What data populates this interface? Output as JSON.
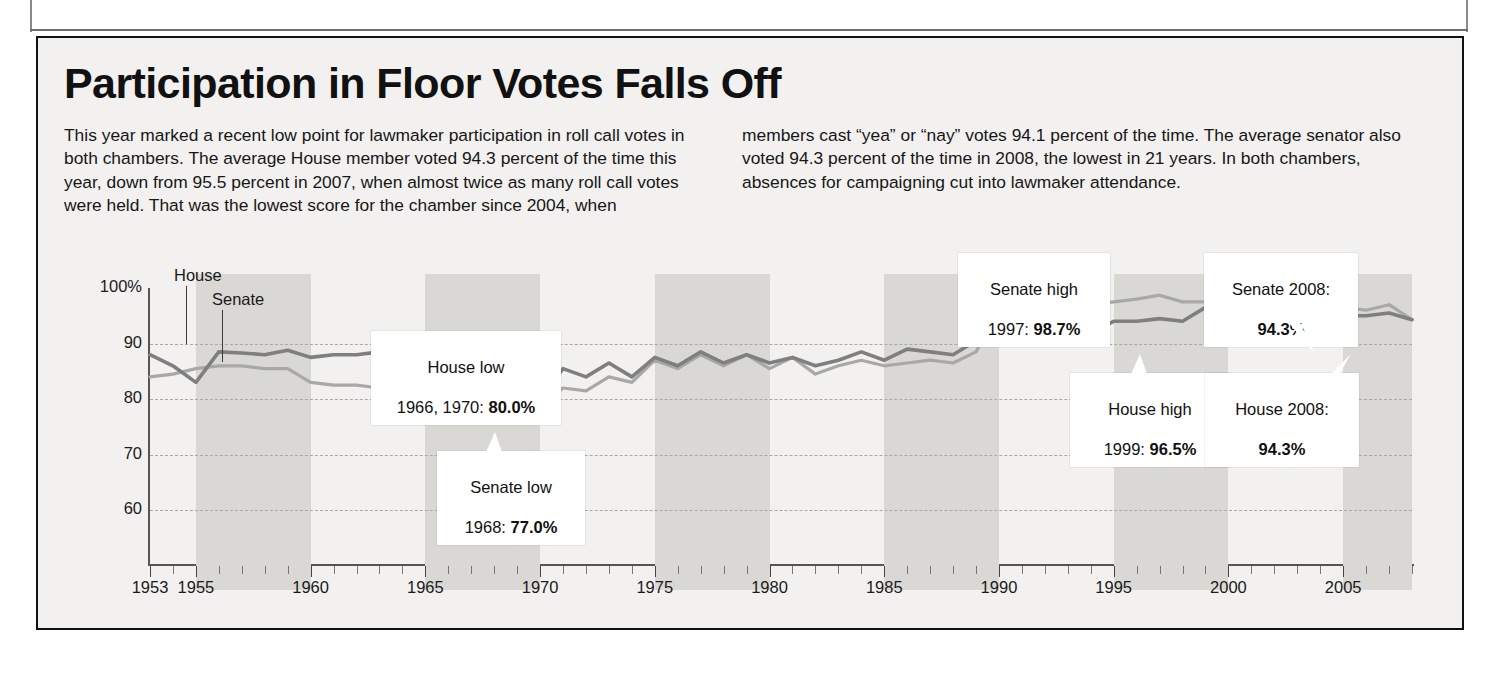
{
  "headline": "Participation in Floor Votes Falls Off",
  "deck": {
    "left": "This year marked a recent low point for lawmaker participation in roll call votes in both chambers. The average House member voted 94.3 percent of the time this year, down from 95.5 percent in 2007, when almost twice as many roll call votes were held. That was the lowest score for the chamber since 2004, when",
    "right": "members cast “yea” or “nay” votes 94.1 percent of the time. The average senator also voted 94.3 percent of the time in 2008, the lowest in 21 years. In both chambers, absences for campaigning cut into lawmaker attendance."
  },
  "series_labels": {
    "house": "House",
    "senate": "Senate"
  },
  "callouts": [
    {
      "id": "house-low",
      "line1": "House low",
      "line2_prefix": "1966, 1970: ",
      "line2_value": "80.0%"
    },
    {
      "id": "senate-low",
      "line1": "Senate low",
      "line2_prefix": "1968: ",
      "line2_value": "77.0%"
    },
    {
      "id": "senate-high",
      "line1": "Senate high",
      "line2_prefix": "1997: ",
      "line2_value": "98.7%"
    },
    {
      "id": "house-high",
      "line1": "House high",
      "line2_prefix": "1999: ",
      "line2_value": "96.5%"
    },
    {
      "id": "senate-2008",
      "line1": "Senate 2008:",
      "line2_prefix": "",
      "line2_value": "94.3%"
    },
    {
      "id": "house-2008",
      "line1": "House 2008:",
      "line2_prefix": "",
      "line2_value": "94.3%"
    }
  ],
  "colors": {
    "house_line": "#7f7f7f",
    "senate_line": "#a8a8a8",
    "band": "#d9d8d5",
    "panel": "#f2f1ef",
    "frame": "#111111",
    "grid": "#aaa8a4"
  },
  "chart_data": {
    "type": "line",
    "title": "Participation in Floor Votes Falls Off",
    "xlabel": "",
    "ylabel": "Percent of roll call votes cast",
    "ylim": [
      55,
      100
    ],
    "xlim": [
      1953,
      2008
    ],
    "grid": true,
    "y_ticks": [
      "100%",
      "90",
      "80",
      "70",
      "60"
    ],
    "y_tick_values": [
      100,
      90,
      80,
      70,
      60
    ],
    "axis_break_below": 60,
    "x_ticks": [
      1953,
      1955,
      1960,
      1965,
      1970,
      1975,
      1980,
      1985,
      1990,
      1995,
      2000,
      2005
    ],
    "x_minor_tick_interval": 1,
    "legend_position": "inline-labels",
    "shaded_bands_note": "Alternating gray vertical bands mark multi-year congressional spans",
    "shaded_bands": [
      [
        1955,
        1960
      ],
      [
        1965,
        1970
      ],
      [
        1975,
        1980
      ],
      [
        1985,
        1990
      ],
      [
        1995,
        2000
      ],
      [
        2005,
        2008
      ]
    ],
    "years": [
      1953,
      1954,
      1955,
      1956,
      1957,
      1958,
      1959,
      1960,
      1961,
      1962,
      1963,
      1964,
      1965,
      1966,
      1967,
      1968,
      1969,
      1970,
      1971,
      1972,
      1973,
      1974,
      1975,
      1976,
      1977,
      1978,
      1979,
      1980,
      1981,
      1982,
      1983,
      1984,
      1985,
      1986,
      1987,
      1988,
      1989,
      1990,
      1991,
      1992,
      1993,
      1994,
      1995,
      1996,
      1997,
      1998,
      1999,
      2000,
      2001,
      2002,
      2003,
      2004,
      2005,
      2006,
      2007,
      2008
    ],
    "series": [
      {
        "name": "House",
        "values": [
          88.0,
          86.0,
          83.0,
          88.5,
          88.3,
          88.0,
          88.8,
          87.5,
          88.0,
          88.0,
          88.5,
          87.0,
          88.5,
          80.0,
          84.5,
          82.5,
          85.0,
          80.0,
          85.5,
          84.0,
          86.5,
          84.0,
          87.5,
          86.0,
          88.5,
          86.5,
          88.0,
          86.5,
          87.5,
          86.0,
          87.0,
          88.5,
          87.0,
          89.0,
          88.5,
          88.0,
          90.5,
          90.0,
          91.5,
          92.0,
          93.0,
          92.0,
          94.0,
          94.0,
          94.5,
          94.0,
          96.5,
          95.5,
          95.0,
          94.5,
          95.0,
          94.1,
          95.0,
          95.0,
          95.5,
          94.3
        ]
      },
      {
        "name": "Senate",
        "values": [
          84.0,
          84.5,
          85.5,
          86.0,
          86.0,
          85.5,
          85.5,
          83.0,
          82.5,
          82.5,
          82.0,
          82.5,
          82.5,
          81.5,
          79.5,
          77.0,
          81.0,
          78.5,
          82.0,
          81.5,
          84.0,
          83.0,
          87.0,
          85.5,
          88.0,
          86.0,
          88.0,
          85.5,
          87.5,
          84.5,
          86.0,
          87.0,
          86.0,
          86.5,
          87.0,
          86.5,
          88.5,
          96.5,
          97.0,
          96.0,
          95.5,
          97.0,
          97.5,
          98.0,
          98.7,
          97.5,
          97.5,
          97.0,
          97.5,
          96.5,
          96.5,
          96.0,
          96.5,
          96.0,
          97.0,
          94.3
        ]
      }
    ],
    "annotations": [
      {
        "label": "House low",
        "years": [
          1966,
          1970
        ],
        "value": 80.0
      },
      {
        "label": "Senate low",
        "years": [
          1968
        ],
        "value": 77.0
      },
      {
        "label": "Senate high",
        "years": [
          1997
        ],
        "value": 98.7
      },
      {
        "label": "House high",
        "years": [
          1999
        ],
        "value": 96.5
      },
      {
        "label": "Senate 2008",
        "years": [
          2008
        ],
        "value": 94.3
      },
      {
        "label": "House 2008",
        "years": [
          2008
        ],
        "value": 94.3
      }
    ]
  }
}
